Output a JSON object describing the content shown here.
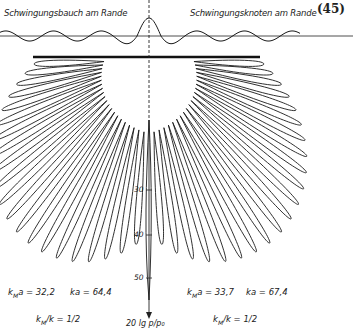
{
  "figure": {
    "equation_number": "(45)",
    "left_title": "Schwingungsbauch am Rande",
    "right_title": "Schwingungsknoten am Rande",
    "axis_label": "20 lg p/p₀",
    "axis_ticks": [
      "30",
      "40",
      "50"
    ],
    "left_params": {
      "kMa_label": "k",
      "kMa_sub": "M",
      "kMa_rest": "a = 32,2",
      "ka": "ka = 64,4",
      "ratio_label": "k",
      "ratio_sub": "M",
      "ratio_rest": "/k = 1/2"
    },
    "right_params": {
      "kMa_label": "k",
      "kMa_sub": "M",
      "kMa_rest": "a = 33,7",
      "ka": "ka = 67,4",
      "ratio_label": "k",
      "ratio_sub": "M",
      "ratio_rest": "/k = 1/2"
    },
    "colors": {
      "ink": "#1a1a1a",
      "background": "#ffffff"
    }
  },
  "chart_data": {
    "type": "polar-directivity",
    "title": "",
    "left_half": {
      "caption": "Schwingungsbauch am Rande",
      "kMa": 32.2,
      "ka": 64.4,
      "kM_over_k": "1/2",
      "lobe_count": 21
    },
    "right_half": {
      "caption": "Schwingungsknoten am Rande",
      "kMa": 33.7,
      "ka": 67.4,
      "kM_over_k": "1/2",
      "lobe_count": 21
    },
    "radial_axis": {
      "label": "20 lg p/p0",
      "ticks": [
        30,
        40,
        50
      ],
      "direction": "downward"
    },
    "top_inset": "standing-wave displacement profile across plate, antinode at left edge vs node at right edge"
  }
}
